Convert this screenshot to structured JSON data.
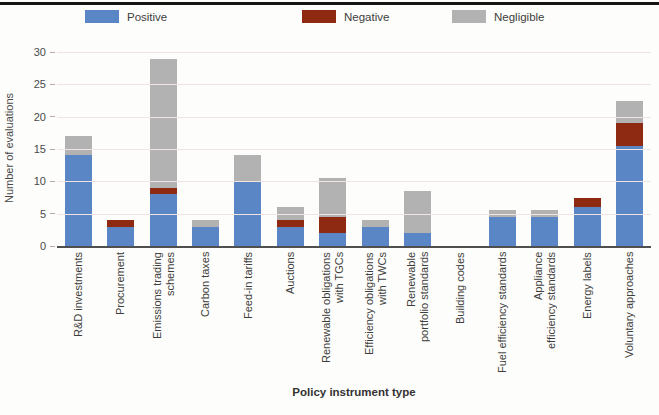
{
  "chart_data": {
    "type": "bar",
    "stacked": true,
    "title": "",
    "xlabel": "Policy instrument type",
    "ylabel": "Number of evaluations",
    "ylim": [
      0,
      30
    ],
    "yticks": [
      0,
      5,
      10,
      15,
      20,
      25,
      30
    ],
    "grid": "horizontal",
    "legend_position": "top",
    "categories": [
      "R&D investments",
      "Procurement",
      "Emissions trading schemes",
      "Carbon taxes",
      "Feed-in tariffs",
      "Auctions",
      "Renewable obligations\nwith TGCs",
      "Efficiency obligations\nwith TWCs",
      "Renewable\nportfolio standards",
      "Building codes",
      "Fuel efficiency standards",
      "Appliance\nefficiency standards",
      "Energy labels",
      "Voluntary approaches"
    ],
    "series": [
      {
        "name": "Positive",
        "color": "#5b86c5",
        "values": [
          14,
          3,
          8,
          3,
          10,
          3,
          2,
          3,
          2,
          0,
          4.5,
          4.5,
          6,
          15.5
        ]
      },
      {
        "name": "Negative",
        "color": "#8e2a12",
        "values": [
          0,
          1,
          1,
          0,
          0,
          1,
          2.5,
          0,
          0,
          0,
          0,
          0,
          1.5,
          3.5
        ]
      },
      {
        "name": "Negligible",
        "color": "#b2b2b2",
        "values": [
          3,
          0,
          20,
          1,
          4,
          2,
          6,
          1,
          6.5,
          0,
          1,
          1,
          0,
          3.5
        ]
      }
    ]
  },
  "axes": {
    "y_label": "Number of evaluations",
    "x_label": "Policy instrument type"
  },
  "legend": {
    "items": [
      {
        "label": "Positive",
        "color": "#5b86c5"
      },
      {
        "label": "Negative",
        "color": "#8e2a12"
      },
      {
        "label": "Negligible",
        "color": "#b2b2b2"
      }
    ]
  },
  "style": {
    "gridline_color": "#f2e3e3",
    "axis_color": "#4f4f4f",
    "top_rule_color": "#151515"
  }
}
